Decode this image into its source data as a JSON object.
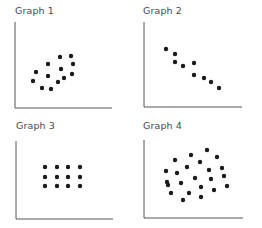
{
  "chart_data": [
    {
      "type": "scatter",
      "title": "Graph 1",
      "xlabel": "",
      "ylabel": "",
      "grid": false,
      "axes": {
        "origin": [
          15,
          108
        ],
        "x_end": 112,
        "y_top": 22
      },
      "points": [
        [
          60,
          57
        ],
        [
          71,
          56
        ],
        [
          48,
          64
        ],
        [
          73,
          64
        ],
        [
          36,
          72
        ],
        [
          61,
          69
        ],
        [
          48,
          76
        ],
        [
          72,
          74
        ],
        [
          33,
          81
        ],
        [
          64,
          78
        ],
        [
          58,
          82
        ],
        [
          42,
          88
        ],
        [
          51,
          89
        ]
      ]
    },
    {
      "type": "scatter",
      "title": "Graph 2",
      "xlabel": "",
      "ylabel": "",
      "grid": false,
      "axes": {
        "origin": [
          144,
          107
        ],
        "x_end": 242,
        "y_top": 22
      },
      "points": [
        [
          166,
          49
        ],
        [
          175,
          54
        ],
        [
          175,
          62
        ],
        [
          183,
          66
        ],
        [
          194,
          63
        ],
        [
          194,
          75
        ],
        [
          204,
          78
        ],
        [
          211,
          82
        ],
        [
          219,
          88
        ]
      ]
    },
    {
      "type": "scatter",
      "title": "Graph 3",
      "xlabel": "",
      "ylabel": "",
      "grid": false,
      "axes": {
        "origin": [
          16,
          219
        ],
        "x_end": 113,
        "y_top": 141
      },
      "points": [
        [
          45,
          167
        ],
        [
          57,
          167
        ],
        [
          68,
          167
        ],
        [
          80,
          167
        ],
        [
          45,
          177
        ],
        [
          57,
          177
        ],
        [
          68,
          177
        ],
        [
          80,
          177
        ],
        [
          45,
          186
        ],
        [
          57,
          186
        ],
        [
          68,
          186
        ],
        [
          80,
          186
        ]
      ]
    },
    {
      "type": "scatter",
      "title": "Graph 4",
      "xlabel": "",
      "ylabel": "",
      "grid": false,
      "axes": {
        "origin": [
          144,
          218
        ],
        "x_end": 243,
        "y_top": 140
      },
      "points": [
        [
          207,
          150
        ],
        [
          191,
          155
        ],
        [
          217,
          157
        ],
        [
          175,
          160
        ],
        [
          200,
          162
        ],
        [
          187,
          167
        ],
        [
          222,
          168
        ],
        [
          166,
          171
        ],
        [
          177,
          173
        ],
        [
          209,
          170
        ],
        [
          224,
          176
        ],
        [
          195,
          178
        ],
        [
          211,
          179
        ],
        [
          167,
          182
        ],
        [
          181,
          183
        ],
        [
          168,
          185
        ],
        [
          227,
          186
        ],
        [
          201,
          187
        ],
        [
          214,
          190
        ],
        [
          171,
          193
        ],
        [
          189,
          193
        ],
        [
          201,
          197
        ],
        [
          183,
          200
        ]
      ]
    }
  ],
  "colors": {
    "dot": "#1a1a1a",
    "axis": "#555555",
    "title": "#4a4a4a"
  },
  "titles": {
    "g1": "Graph 1",
    "g2": "Graph 2",
    "g3": "Graph 3",
    "g4": "Graph 4"
  }
}
